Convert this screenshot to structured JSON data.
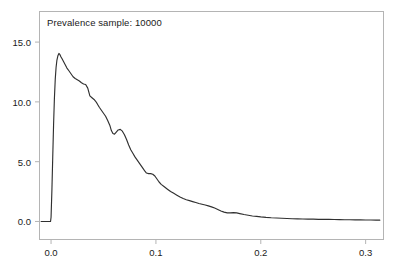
{
  "chart_data": {
    "type": "line",
    "title": "Prevalence sample: 10000",
    "xlabel": "",
    "ylabel": "",
    "xlim": [
      -0.0115,
      0.3175
    ],
    "ylim": [
      -1.55,
      17.6
    ],
    "grid": false,
    "legend": null,
    "line_color": "#303030",
    "frame_color": "#b4b4b4",
    "xticks": [
      0.0,
      0.1,
      0.2,
      0.3
    ],
    "xticklabels": [
      "0.0",
      "0.1",
      "0.2",
      "0.3"
    ],
    "yticks": [
      0.0,
      5.0,
      10.0,
      15.0
    ],
    "yticklabels": [
      "0.0",
      "5.0",
      "10.0",
      "15.0"
    ],
    "x": [
      -0.0095,
      -0.006,
      -0.003,
      -0.0015,
      -0.0005,
      0.0,
      0.0008,
      0.0016,
      0.0024,
      0.0032,
      0.004,
      0.0048,
      0.0056,
      0.0065,
      0.0075,
      0.0085,
      0.0095,
      0.0105,
      0.012,
      0.0135,
      0.015,
      0.017,
      0.019,
      0.021,
      0.023,
      0.025,
      0.027,
      0.029,
      0.031,
      0.033,
      0.035,
      0.037,
      0.039,
      0.041,
      0.0425,
      0.044,
      0.046,
      0.048,
      0.05,
      0.052,
      0.054,
      0.056,
      0.0575,
      0.059,
      0.0605,
      0.062,
      0.064,
      0.066,
      0.068,
      0.07,
      0.072,
      0.074,
      0.076,
      0.078,
      0.08,
      0.082,
      0.084,
      0.086,
      0.088,
      0.0895,
      0.091,
      0.093,
      0.095,
      0.097,
      0.099,
      0.101,
      0.103,
      0.105,
      0.108,
      0.111,
      0.114,
      0.117,
      0.12,
      0.123,
      0.126,
      0.129,
      0.132,
      0.135,
      0.138,
      0.141,
      0.144,
      0.147,
      0.15,
      0.153,
      0.156,
      0.159,
      0.162,
      0.165,
      0.168,
      0.171,
      0.174,
      0.177,
      0.18,
      0.184,
      0.188,
      0.192,
      0.196,
      0.2,
      0.205,
      0.21,
      0.215,
      0.22,
      0.225,
      0.23,
      0.235,
      0.24,
      0.245,
      0.25,
      0.255,
      0.26,
      0.265,
      0.27,
      0.275,
      0.28,
      0.285,
      0.29,
      0.295,
      0.3,
      0.305,
      0.31,
      0.3135
    ],
    "y": [
      0.0,
      0.0,
      0.0,
      0.0,
      0.0,
      0.35,
      2.6,
      5.4,
      8.1,
      10.3,
      11.9,
      12.9,
      13.5,
      13.85,
      14.05,
      13.95,
      13.75,
      13.6,
      13.35,
      13.1,
      12.85,
      12.6,
      12.35,
      12.1,
      11.95,
      11.85,
      11.75,
      11.6,
      11.5,
      11.45,
      11.15,
      10.5,
      10.35,
      10.2,
      10.05,
      9.85,
      9.55,
      9.3,
      9.05,
      8.8,
      8.45,
      8.05,
      7.6,
      7.35,
      7.3,
      7.45,
      7.65,
      7.7,
      7.55,
      7.25,
      6.85,
      6.4,
      6.0,
      5.7,
      5.4,
      5.15,
      4.9,
      4.65,
      4.4,
      4.2,
      4.05,
      4.0,
      4.0,
      3.95,
      3.8,
      3.55,
      3.3,
      3.1,
      2.9,
      2.7,
      2.5,
      2.35,
      2.2,
      2.05,
      1.92,
      1.82,
      1.74,
      1.66,
      1.58,
      1.5,
      1.44,
      1.38,
      1.3,
      1.22,
      1.12,
      1.0,
      0.88,
      0.78,
      0.72,
      0.72,
      0.74,
      0.72,
      0.66,
      0.58,
      0.52,
      0.46,
      0.42,
      0.38,
      0.34,
      0.31,
      0.29,
      0.27,
      0.25,
      0.23,
      0.22,
      0.21,
      0.2,
      0.19,
      0.18,
      0.17,
      0.17,
      0.16,
      0.15,
      0.14,
      0.14,
      0.13,
      0.13,
      0.12,
      0.12,
      0.11,
      0.11
    ]
  }
}
